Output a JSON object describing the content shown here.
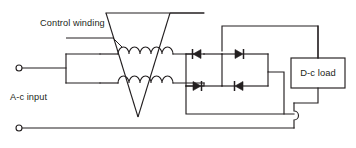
{
  "diagram": {
    "type": "schematic",
    "background_color": "#ffffff",
    "line_color": "#231f20",
    "labels": {
      "control_winding": "Control winding",
      "ac_input": "A-c input",
      "dc_load": "D-c load"
    },
    "components": {
      "control_winding_core": {
        "name": "control-winding-core",
        "shape": "v-shaped-triangle",
        "description": "Triangular control winding core crossing both gate windings"
      },
      "gate_winding_top": {
        "name": "gate-winding-top",
        "turns": 5
      },
      "gate_winding_bottom": {
        "name": "gate-winding-bottom",
        "turns": 5
      },
      "input_block": {
        "name": "ac-input-block",
        "shape": "rectangle"
      },
      "diodes": [
        {
          "id": "diode-top-left",
          "direction": "left",
          "row": "top"
        },
        {
          "id": "diode-top-right",
          "direction": "right",
          "row": "top"
        },
        {
          "id": "diode-bottom-left",
          "direction": "right",
          "row": "bottom"
        },
        {
          "id": "diode-bottom-right",
          "direction": "left",
          "row": "bottom"
        }
      ],
      "terminals": [
        {
          "id": "ac-terminal-top",
          "x": 18,
          "y": 68
        },
        {
          "id": "ac-terminal-bottom",
          "x": 18,
          "y": 128
        }
      ],
      "wire_hop": {
        "name": "wire-crossover-hop",
        "x": 294,
        "y": 114
      },
      "load_box": {
        "name": "dc-load-box",
        "x": 295,
        "y": 58,
        "width": 54,
        "height": 30
      }
    }
  }
}
